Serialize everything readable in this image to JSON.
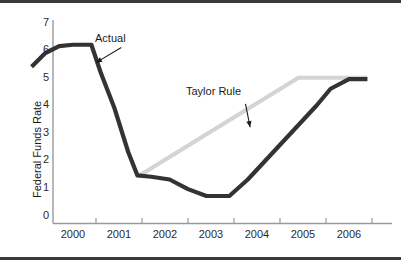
{
  "chart_data": {
    "type": "line",
    "title": "",
    "xlabel": "",
    "ylabel": "Federal Funds Rate",
    "xlim": [
      1999.5,
      2007.0
    ],
    "ylim": [
      0,
      7.4
    ],
    "grid": false,
    "legend_position": "inline-annotations",
    "xticks": [
      "2000",
      "2001",
      "2002",
      "2003",
      "2004",
      "2005",
      "2006"
    ],
    "xtick_values": [
      2000,
      2001,
      2002,
      2003,
      2004,
      2005,
      2006
    ],
    "yticks": [
      "0",
      "1",
      "2",
      "3",
      "4",
      "5",
      "6",
      "7"
    ],
    "ytick_values": [
      0,
      1,
      2,
      3,
      4,
      5,
      6,
      7
    ],
    "series": [
      {
        "name": "Actual",
        "color": "#333333",
        "x": [
          1999.6,
          1999.9,
          2000.2,
          2000.5,
          2000.9,
          2001.1,
          2001.4,
          2001.7,
          2001.9,
          2002.2,
          2002.6,
          2003.0,
          2003.4,
          2003.9,
          2004.3,
          2004.8,
          2005.3,
          2005.8,
          2006.1,
          2006.5,
          2006.9
        ],
        "values": [
          5.7,
          6.2,
          6.45,
          6.5,
          6.5,
          5.5,
          4.2,
          2.6,
          1.75,
          1.7,
          1.6,
          1.25,
          1.0,
          1.0,
          1.6,
          2.5,
          3.4,
          4.3,
          4.9,
          5.25,
          5.25
        ]
      },
      {
        "name": "Taylor Rule",
        "color": "#d4d4d4",
        "x": [
          2001.9,
          2005.4,
          2006.9
        ],
        "values": [
          1.7,
          5.3,
          5.3
        ]
      }
    ],
    "annotations": [
      {
        "label": "Actual",
        "text_x": 2001.0,
        "text_y": 6.95,
        "arrow_from_x": 2001.55,
        "arrow_from_y": 6.4,
        "arrow_to_x": 2001.0,
        "arrow_to_y": 5.85
      },
      {
        "label": "Taylor Rule",
        "text_x": 2003.9,
        "text_y": 4.7,
        "arrow_from_x": 2004.25,
        "arrow_from_y": 4.35,
        "arrow_to_x": 2004.35,
        "arrow_to_y": 3.5
      }
    ]
  }
}
